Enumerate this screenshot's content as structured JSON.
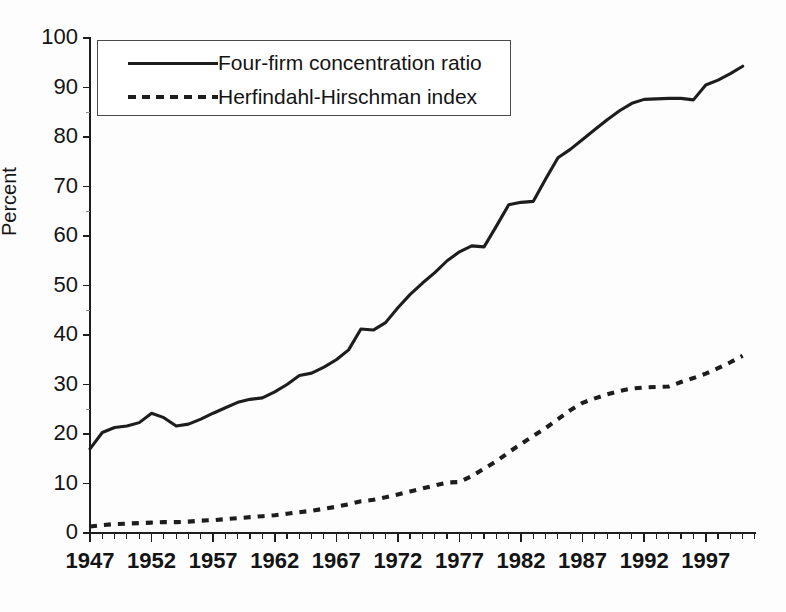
{
  "chart_data": {
    "type": "line",
    "title": "",
    "xlabel": "",
    "ylabel": "Percent",
    "xlim": [
      1947,
      2001
    ],
    "ylim": [
      0,
      100
    ],
    "ytick_labels": [
      "0",
      "10",
      "20",
      "30",
      "40",
      "50",
      "60",
      "70",
      "80",
      "90",
      "100"
    ],
    "ytick_values": [
      0,
      10,
      20,
      30,
      40,
      50,
      60,
      70,
      80,
      90,
      100
    ],
    "xtick_labels": [
      "1947",
      "1952",
      "1957",
      "1962",
      "1967",
      "1972",
      "1977",
      "1982",
      "1987",
      "1992",
      "1997"
    ],
    "xtick_values": [
      1947,
      1952,
      1957,
      1962,
      1967,
      1972,
      1977,
      1982,
      1987,
      1992,
      1997
    ],
    "grid": false,
    "legend_position": "upper-left-inside",
    "x": [
      1947,
      1948,
      1949,
      1950,
      1951,
      1952,
      1953,
      1954,
      1955,
      1956,
      1957,
      1958,
      1959,
      1960,
      1961,
      1962,
      1963,
      1964,
      1965,
      1966,
      1967,
      1968,
      1969,
      1970,
      1971,
      1972,
      1973,
      1974,
      1975,
      1976,
      1977,
      1978,
      1979,
      1980,
      1981,
      1982,
      1983,
      1984,
      1985,
      1986,
      1987,
      1988,
      1989,
      1990,
      1991,
      1992,
      1993,
      1994,
      1995,
      1996,
      1997,
      1998,
      1999,
      2000
    ],
    "series": [
      {
        "name": "Four-firm concentration ratio",
        "style": "solid",
        "color": "#1d1d1d",
        "values": [
          17.0,
          20.3,
          21.3,
          21.6,
          22.3,
          24.2,
          23.3,
          21.6,
          22.0,
          23.0,
          24.2,
          25.3,
          26.4,
          27.0,
          27.3,
          28.5,
          30.0,
          31.8,
          32.3,
          33.5,
          35.0,
          37.0,
          41.2,
          41.0,
          42.5,
          45.5,
          48.2,
          50.5,
          52.6,
          55.0,
          56.8,
          58.0,
          57.8,
          62.0,
          66.3,
          66.8,
          67.0,
          71.5,
          75.8,
          77.5,
          79.5,
          81.5,
          83.5,
          85.3,
          86.8,
          87.6,
          87.7,
          87.8,
          87.8,
          87.5,
          90.5,
          91.5,
          92.8,
          94.3
        ]
      },
      {
        "name": "Herfindahl-Hirschman index",
        "style": "dashed",
        "color": "#1d1d1d",
        "values": [
          1.3,
          1.6,
          1.8,
          1.9,
          2.0,
          2.1,
          2.2,
          2.2,
          2.3,
          2.5,
          2.6,
          2.8,
          3.0,
          3.2,
          3.4,
          3.6,
          3.9,
          4.2,
          4.5,
          4.9,
          5.3,
          5.8,
          6.4,
          6.7,
          7.2,
          7.8,
          8.4,
          9.0,
          9.6,
          10.2,
          10.3,
          11.5,
          13.0,
          14.5,
          16.3,
          18.0,
          19.6,
          21.2,
          23.0,
          24.8,
          26.3,
          27.2,
          28.0,
          28.7,
          29.2,
          29.4,
          29.5,
          29.6,
          30.5,
          31.3,
          32.2,
          33.3,
          34.5,
          35.8
        ]
      }
    ]
  },
  "legend": {
    "items": [
      {
        "label": "Four-firm concentration ratio",
        "style": "solid"
      },
      {
        "label": "Herfindahl-Hirschman index",
        "style": "dashed"
      }
    ]
  },
  "axis": {
    "y_title": "Percent"
  }
}
